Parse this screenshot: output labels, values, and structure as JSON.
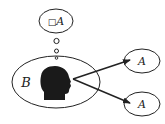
{
  "diagram": {
    "thought_bubble": {
      "box_symbol": "□",
      "label": "A"
    },
    "agent_ellipse": {
      "label": "B"
    },
    "targets": [
      {
        "label": "A"
      },
      {
        "label": "A"
      }
    ],
    "colors": {
      "stroke": "#222222",
      "head": "#1a1a1a",
      "background": "#ffffff"
    }
  }
}
